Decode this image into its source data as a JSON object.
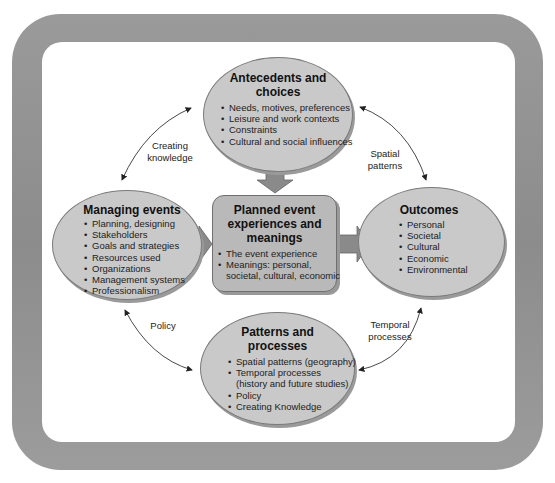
{
  "diagram": {
    "nodes": {
      "antecedents": {
        "title_line1": "Antecedents and",
        "title_line2": "choices",
        "items": [
          "Needs, motives, preferences",
          "Leisure and work contexts",
          "Constraints",
          "Cultural and social influences"
        ]
      },
      "managing": {
        "title": "Managing events",
        "items": [
          "Planning, designing",
          "Stakeholders",
          "Goals and strategies",
          "Resources used",
          "Organizations",
          "Management systems",
          "Professionalism"
        ]
      },
      "planned": {
        "title_line1": "Planned event",
        "title_line2": "experiences and",
        "title_line3": "meanings",
        "items": [
          "The event experience",
          "Meanings: personal,",
          "societal, cultural, economic"
        ]
      },
      "outcomes": {
        "title": "Outcomes",
        "items": [
          "Personal",
          "Societal",
          "Cultural",
          "Economic",
          "Environmental"
        ]
      },
      "patterns": {
        "title_line1": "Patterns and",
        "title_line2": "processes",
        "items": [
          "Spatial patterns (geography)",
          "Temporal processes",
          "(history and future studies)",
          "Policy",
          "Creating Knowledge"
        ]
      }
    },
    "edge_labels": {
      "creating_knowledge_1": "Creating",
      "creating_knowledge_2": "knowledge",
      "spatial_1": "Spatial",
      "spatial_2": "patterns",
      "policy": "Policy",
      "temporal_1": "Temporal",
      "temporal_2": "processes"
    },
    "colors": {
      "frame": "#949494",
      "ellipse_fill": "#c9c9c9",
      "box_fill": "#b9b9b9",
      "block_arrow": "#8a8a8a"
    }
  }
}
